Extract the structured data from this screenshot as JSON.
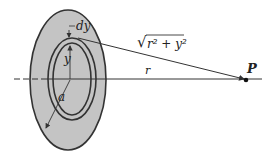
{
  "labels": {
    "dy": "dy",
    "y": "y",
    "a": "a",
    "r": "r",
    "P": "P",
    "distance_radicand": "r² + y²",
    "distance_sqrt": "√"
  },
  "colors": {
    "disc_fill": "#c4c4c4",
    "stroke": "#333333",
    "background": "#ffffff"
  }
}
